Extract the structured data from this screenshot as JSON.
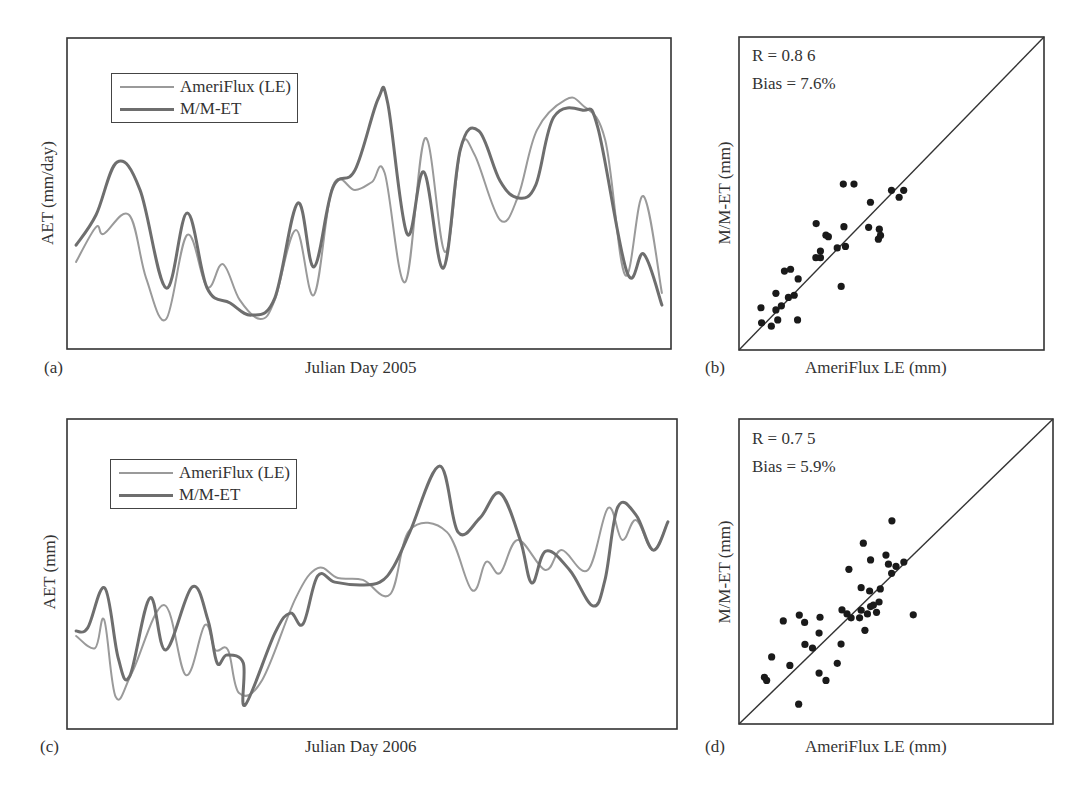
{
  "figure": {
    "panels": {
      "a": {
        "tag": "(a)",
        "xlabel": "Julian Day 2005",
        "ylabel": "AET (mm/day)"
      },
      "b": {
        "tag": "(b)",
        "xlabel": "AmeriFlux LE (mm)",
        "ylabel": "M/M-ET (mm)",
        "stat_r": "R = 0.8 6",
        "stat_bias": "Bias = 7.6%"
      },
      "c": {
        "tag": "(c)",
        "xlabel": "Julian Day 2006",
        "ylabel": "AET (mm)"
      },
      "d": {
        "tag": "(d)",
        "xlabel": "AmeriFlux LE (mm)",
        "ylabel": "M/M-ET (mm)",
        "stat_r": "R = 0.7 5",
        "stat_bias": "Bias = 5.9%"
      }
    },
    "legend": {
      "series1": "AmeriFlux (LE)",
      "series2": "M/M-ET"
    },
    "colors": {
      "ameriflux": "#9a9a9a",
      "mmet": "#6e6e6e",
      "axis": "#333333",
      "dot": "#1a1a1a"
    }
  },
  "chart_data": [
    {
      "panel": "a",
      "type": "line",
      "title": "",
      "xlabel": "Julian Day 2005",
      "ylabel": "AET (mm/day)",
      "note": "No tick labels shown; x and y are relative units 0-100 across the plot box",
      "xlim": [
        0,
        100
      ],
      "ylim": [
        0,
        100
      ],
      "grid": false,
      "legend_position": "upper left",
      "series": [
        {
          "name": "AmeriFlux (LE)",
          "x": [
            1.5,
            4.8,
            6.1,
            10.3,
            13.1,
            16.4,
            19.9,
            23.2,
            25.8,
            28.6,
            32.0,
            34.4,
            37.9,
            40.9,
            44.0,
            47.7,
            50.5,
            52.6,
            56.0,
            59.3,
            62.6,
            65.2,
            67.5,
            71.7,
            74.7,
            77.8,
            82.5,
            85.3,
            89.1,
            92.4,
            95.4,
            98.5
          ],
          "y": [
            28.0,
            39.2,
            37.0,
            43.1,
            22.8,
            9.6,
            36.7,
            19.9,
            27.3,
            15.8,
            9.6,
            15.8,
            38.3,
            17.4,
            52.4,
            51.1,
            53.7,
            56.6,
            21.5,
            67.8,
            31.2,
            64.6,
            62.4,
            41.5,
            49.2,
            70.4,
            80.1,
            78.5,
            67.2,
            23.8,
            49.2,
            18.0
          ]
        },
        {
          "name": "M/M-ET",
          "x": [
            1.5,
            4.8,
            8.3,
            12.1,
            16.4,
            19.9,
            23.2,
            27.0,
            30.6,
            34.4,
            38.2,
            40.9,
            44.0,
            47.7,
            51.5,
            53.1,
            56.3,
            59.1,
            62.3,
            65.1,
            68.2,
            71.7,
            74.7,
            77.6,
            80.6,
            85.4,
            87.9,
            92.7,
            95.5,
            98.5
          ],
          "y": [
            33.4,
            43.1,
            60.1,
            51.1,
            19.6,
            43.7,
            19.6,
            14.8,
            10.9,
            16.4,
            46.9,
            26.4,
            51.8,
            57.6,
            80.4,
            79.1,
            37.0,
            56.9,
            26.0,
            64.0,
            70.1,
            54.0,
            48.6,
            52.7,
            74.6,
            76.8,
            71.1,
            24.8,
            30.5,
            14.1
          ]
        }
      ]
    },
    {
      "panel": "b",
      "type": "scatter",
      "title": "",
      "xlabel": "AmeriFlux LE (mm)",
      "ylabel": "M/M-ET (mm)",
      "note": "No tick labels shown; relative units 0-100; 1:1 line drawn",
      "xlim": [
        0,
        100
      ],
      "ylim": [
        0,
        100
      ],
      "grid": false,
      "annotations": [
        "R = 0.86",
        "Bias = 7.6%"
      ],
      "reference_line": {
        "type": "1:1"
      },
      "points": {
        "x": [
          7.2,
          7.4,
          10.6,
          12.7,
          12.1,
          13.9,
          12.1,
          14.9,
          16.9,
          16.2,
          18.1,
          19.4,
          19.2,
          25.3,
          25.2,
          26.7,
          26.7,
          28.5,
          29.3,
          32.2,
          33.5,
          34.2,
          37.7,
          34.4,
          34.9,
          42.5,
          43.1,
          45.7,
          46.0,
          46.4,
          50.0,
          52.5,
          54.0
        ],
        "y": [
          13.5,
          8.7,
          7.6,
          9.6,
          12.8,
          14.1,
          18.1,
          25.2,
          25.8,
          16.8,
          17.5,
          22.7,
          9.6,
          40.4,
          29.5,
          31.6,
          29.5,
          36.7,
          36.2,
          32.6,
          20.3,
          53.0,
          53.0,
          39.4,
          33.1,
          39.2,
          47.2,
          35.4,
          38.6,
          36.6,
          51.0,
          48.8,
          51.0
        ]
      }
    },
    {
      "panel": "c",
      "type": "line",
      "title": "",
      "xlabel": "Julian Day 2006",
      "ylabel": "AET (mm)",
      "note": "No tick labels shown; x and y are relative units 0-100 across the plot box",
      "xlim": [
        0,
        100
      ],
      "ylim": [
        0,
        100
      ],
      "grid": false,
      "legend_position": "upper left",
      "series": [
        {
          "name": "AmeriFlux (LE)",
          "x": [
            1.5,
            4.6,
            6.1,
            8.0,
            10.7,
            15.9,
            19.5,
            22.6,
            24.3,
            26.4,
            28.2,
            32.0,
            37.5,
            41.1,
            44.4,
            48.5,
            53.0,
            56.2,
            62.3,
            66.4,
            68.7,
            71.0,
            73.9,
            78.4,
            81.1,
            85.4,
            88.7,
            91.0,
            93.3,
            96.1,
            98.5
          ],
          "y": [
            30.0,
            26.1,
            35.2,
            10.3,
            18.4,
            40.0,
            17.4,
            33.5,
            25.5,
            25.5,
            11.6,
            15.8,
            42.3,
            51.9,
            48.7,
            48.1,
            43.5,
            64.2,
            63.5,
            44.8,
            53.9,
            50.3,
            61.0,
            51.3,
            57.7,
            51.3,
            71.3,
            61.0,
            67.4,
            57.7,
            66.8
          ]
        },
        {
          "name": "M/M-ET",
          "x": [
            1.5,
            3.4,
            6.2,
            8.4,
            10.3,
            13.6,
            16.2,
            20.5,
            23.1,
            24.6,
            26.2,
            28.9,
            29.2,
            34.1,
            36.6,
            38.7,
            41.1,
            43.9,
            48.0,
            51.3,
            53.6,
            56.2,
            61.1,
            64.1,
            67.7,
            71.0,
            74.3,
            76.2,
            78.5,
            82.4,
            86.2,
            88.2,
            90.3,
            93.3,
            96.1,
            98.5
          ],
          "y": [
            31.6,
            32.6,
            45.5,
            22.9,
            17.1,
            42.3,
            25.5,
            45.8,
            35.2,
            21.3,
            23.9,
            21.3,
            7.7,
            31.0,
            37.4,
            33.9,
            49.4,
            47.4,
            46.5,
            47.4,
            52.6,
            63.5,
            84.8,
            63.5,
            68.1,
            76.1,
            61.0,
            47.1,
            57.4,
            51.3,
            39.7,
            48.1,
            71.6,
            69.0,
            57.7,
            66.8
          ]
        }
      ]
    },
    {
      "panel": "d",
      "type": "scatter",
      "title": "",
      "xlabel": "AmeriFlux LE (mm)",
      "ylabel": "M/M-ET (mm)",
      "note": "No tick labels shown; relative units 0-100; 1:1 line drawn",
      "xlim": [
        0,
        100
      ],
      "ylim": [
        0,
        100
      ],
      "grid": false,
      "annotations": [
        "R = 0.75",
        "Bias = 5.9%"
      ],
      "reference_line": {
        "type": "1:1"
      },
      "points": {
        "x": [
          48.7,
          39.6,
          41.9,
          46.8,
          47.6,
          50.0,
          52.5,
          48.6,
          35.0,
          38.9,
          41.6,
          45.0,
          44.6,
          42.8,
          41.9,
          43.8,
          40.9,
          38.9,
          38.4,
          40.1,
          32.8,
          34.4,
          35.7,
          55.5,
          19.2,
          14.1,
          20.9,
          25.8,
          25.5,
          21.0,
          23.4,
          32.5,
          10.4,
          16.2,
          25.5,
          27.7,
          31.3,
          8.1,
          8.8,
          19.0
        ],
        "y": [
          66.6,
          59.3,
          53.8,
          55.4,
          52.4,
          51.7,
          53.1,
          49.4,
          50.7,
          44.7,
          43.6,
          44.3,
          40.0,
          39.0,
          38.5,
          36.6,
          36.1,
          37.3,
          34.8,
          30.7,
          37.4,
          36.1,
          34.8,
          35.8,
          35.7,
          33.8,
          33.3,
          35.0,
          29.8,
          26.1,
          24.9,
          26.2,
          22.0,
          19.2,
          16.7,
          14.3,
          19.9,
          15.3,
          14.3,
          6.5
        ]
      }
    }
  ]
}
